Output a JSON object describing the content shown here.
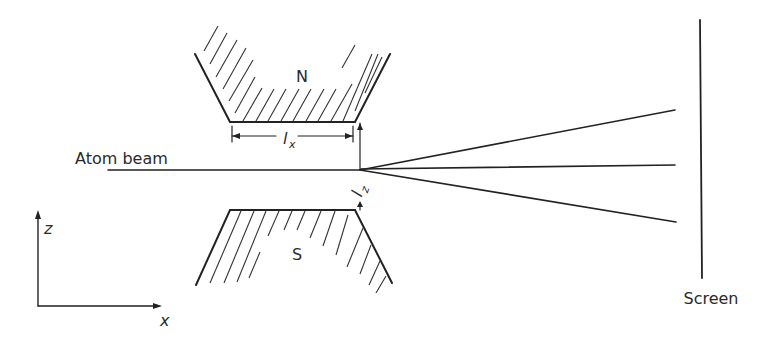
{
  "figure": {
    "labels": {
      "north_pole": "N",
      "south_pole": "S",
      "beam": "Atom beam",
      "screen": "Screen",
      "length_x": "l",
      "length_x_sub": "x",
      "length_z": "l",
      "length_z_sub": "z",
      "axis_z": "z",
      "axis_x": "x"
    },
    "colors": {
      "ink": "#222222",
      "background": "#ffffff"
    },
    "beams_after_magnet": 3
  }
}
